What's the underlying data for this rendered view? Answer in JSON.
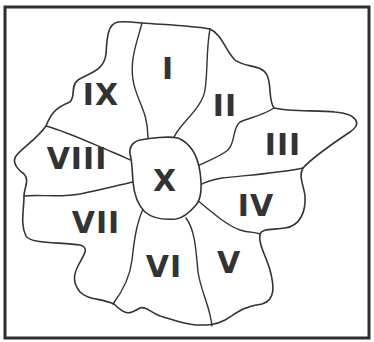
{
  "diagram": {
    "type": "region-map",
    "colors": {
      "stroke": "#333333",
      "background": "#ffffff",
      "label": "#333333"
    },
    "regions": [
      {
        "id": "I",
        "label": "I",
        "x": 168,
        "y": 68
      },
      {
        "id": "II",
        "label": "II",
        "x": 225,
        "y": 105
      },
      {
        "id": "III",
        "label": "III",
        "x": 283,
        "y": 144
      },
      {
        "id": "IV",
        "label": "IV",
        "x": 256,
        "y": 205
      },
      {
        "id": "V",
        "label": "V",
        "x": 229,
        "y": 262
      },
      {
        "id": "VI",
        "label": "VI",
        "x": 164,
        "y": 266
      },
      {
        "id": "VII",
        "label": "VII",
        "x": 96,
        "y": 222
      },
      {
        "id": "VIII",
        "label": "VIII",
        "x": 77,
        "y": 158
      },
      {
        "id": "IX",
        "label": "IX",
        "x": 101,
        "y": 94
      },
      {
        "id": "X",
        "label": "X",
        "x": 165,
        "y": 180
      }
    ]
  }
}
